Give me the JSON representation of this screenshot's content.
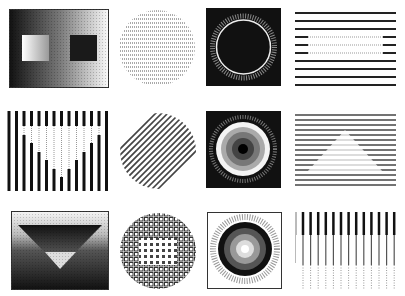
{
  "grid": {
    "rows": 3,
    "cols": 4,
    "background": "#ffffff",
    "ink": "#111111"
  },
  "tiles": [
    {
      "id": "r1c1",
      "label": "gradient-with-two-rectangles",
      "type": "framed-gradient"
    },
    {
      "id": "r1c2",
      "label": "dotted-line-disk",
      "type": "disk-horizontal-dotted-lines"
    },
    {
      "id": "r1c3",
      "label": "black-square-white-ring",
      "type": "framed-ring"
    },
    {
      "id": "r1c4",
      "label": "horizontal-lines-with-gap",
      "type": "horizontal-lines"
    },
    {
      "id": "r2c1",
      "label": "vertical-bars-triangle",
      "type": "vertical-bars"
    },
    {
      "id": "r2c2",
      "label": "diagonal-line-disk",
      "type": "disk-diagonal-lines"
    },
    {
      "id": "r2c3",
      "label": "concentric-gray-disk",
      "type": "framed-target"
    },
    {
      "id": "r2c4",
      "label": "horizontal-lines-triangle",
      "type": "horizontal-lines"
    },
    {
      "id": "r3c1",
      "label": "gradient-inverted-triangles",
      "type": "framed-gradient"
    },
    {
      "id": "r3c2",
      "label": "checker-disk",
      "type": "disk-grid"
    },
    {
      "id": "r3c3",
      "label": "framed-gray-rings",
      "type": "framed-target"
    },
    {
      "id": "r3c4",
      "label": "vertical-lines-fade",
      "type": "vertical-lines"
    }
  ]
}
